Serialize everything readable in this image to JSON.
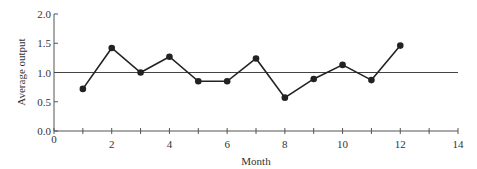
{
  "chart_data": {
    "type": "line",
    "title": "",
    "xlabel": "Month",
    "ylabel": "Average output",
    "xlim": [
      0,
      14
    ],
    "ylim": [
      0.0,
      2.0
    ],
    "x_ticks": [
      0,
      2,
      4,
      6,
      8,
      10,
      12,
      14
    ],
    "x_minor_ticks": [
      1,
      3,
      5,
      7,
      9,
      11,
      13
    ],
    "y_ticks": [
      "0.0",
      "0.5",
      "1.0",
      "1.5",
      "2.0"
    ],
    "grid": false,
    "reference_line": {
      "y": 1.0,
      "label": "center line"
    },
    "series": [
      {
        "name": "Average output",
        "x": [
          1,
          2,
          3,
          4,
          5,
          6,
          7,
          8,
          9,
          10,
          11,
          12
        ],
        "values": [
          0.72,
          1.42,
          1.0,
          1.27,
          0.85,
          0.85,
          1.24,
          0.57,
          0.89,
          1.13,
          0.87,
          1.46
        ],
        "marker": "circle",
        "color": "#222222"
      }
    ]
  }
}
